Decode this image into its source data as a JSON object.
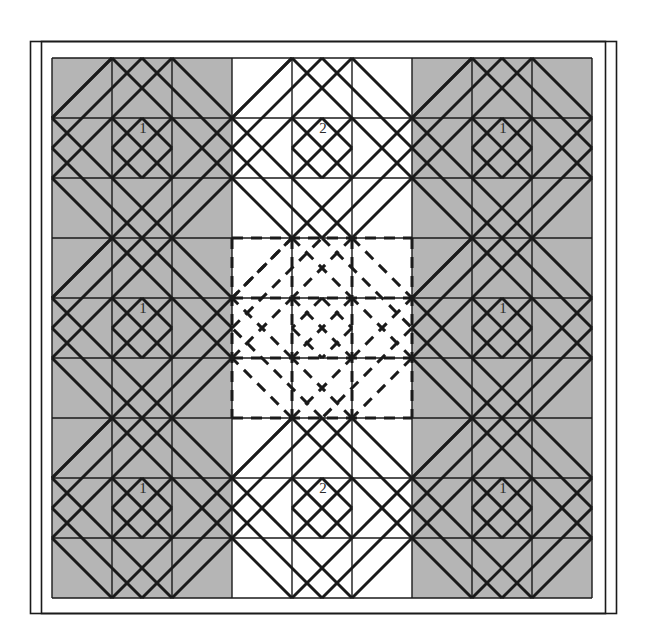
{
  "figure": {
    "kind": "geometric-quilt-tiling",
    "background_color": "#ffffff",
    "shaded_color": "#b5b5b5",
    "unshaded_color": "#ffffff",
    "line_color": "#1a1a1a",
    "dashed_line_color": "#1a1a1a",
    "frame": {
      "outer": {
        "x": 30,
        "y": 41,
        "width": 586,
        "height": 572
      },
      "inner": {
        "x": 41,
        "y": 41,
        "width": 564,
        "height": 572
      },
      "stroke_width": 1.6
    },
    "grid": {
      "origin_x": 52,
      "origin_y": 58,
      "cell": 60,
      "cols": 9,
      "rows": 9,
      "grid_stroke_width": 1.4,
      "diagonal_stroke_width": 3.0
    },
    "block": {
      "size_in_cells": 3,
      "blocks_across": 3,
      "blocks_down": 3,
      "shading_map": [
        [
          "shaded",
          "unshaded",
          "shaded"
        ],
        [
          "shaded",
          "dashed",
          "shaded"
        ],
        [
          "shaded",
          "unshaded",
          "shaded"
        ]
      ]
    },
    "labels": [
      {
        "text": "1",
        "x": 143,
        "y": 128
      },
      {
        "text": "2",
        "x": 323,
        "y": 128
      },
      {
        "text": "1",
        "x": 503,
        "y": 128
      },
      {
        "text": "1",
        "x": 143,
        "y": 308
      },
      {
        "text": "1",
        "x": 503,
        "y": 308
      },
      {
        "text": "1",
        "x": 143,
        "y": 488
      },
      {
        "text": "2",
        "x": 323,
        "y": 488
      },
      {
        "text": "1",
        "x": 503,
        "y": 488
      }
    ],
    "legend": {
      "tile_1_name": "1",
      "tile_2_name": "2"
    }
  },
  "chart_data": {
    "type": "diagram",
    "categories": [
      "shaded",
      "unshaded",
      "dashed"
    ],
    "values": [
      6,
      2,
      1
    ],
    "xlabel": "block style",
    "ylabel": "count of 3x3 blocks",
    "annotations": [
      "1",
      "2",
      "1",
      "1",
      "1",
      "1",
      "2",
      "1"
    ]
  }
}
